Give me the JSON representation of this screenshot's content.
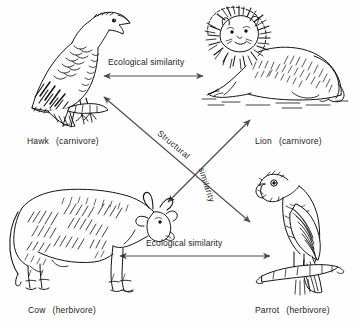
{
  "diagram": {
    "background_color": "#ffffff",
    "ink_color": "#1b1b1b",
    "arrow_color": "#4a4f54",
    "nodes": [
      {
        "id": "hawk",
        "name": "Hawk",
        "diet": "(carnivore)",
        "icon": "hawk-engraving",
        "position": "top-left"
      },
      {
        "id": "lion",
        "name": "Lion",
        "diet": "(carnivore)",
        "icon": "lion-engraving",
        "position": "top-right"
      },
      {
        "id": "cow",
        "name": "Cow",
        "diet": "(herbivore)",
        "icon": "cow-engraving",
        "position": "bottom-left"
      },
      {
        "id": "parrot",
        "name": "Parrot",
        "diet": "(herbivore)",
        "icon": "parrot-engraving",
        "position": "bottom-right"
      }
    ],
    "connections": [
      {
        "id": "hawk-lion",
        "label": "Ecological similarity",
        "from": "hawk",
        "to": "lion",
        "style": "double-headed",
        "orientation": "horizontal"
      },
      {
        "id": "cow-parrot",
        "label": "Ecological similarity",
        "from": "cow",
        "to": "parrot",
        "style": "double-headed",
        "orientation": "horizontal"
      },
      {
        "id": "hawk-parrot",
        "label_line1": "Structural",
        "label_line2": "similarity",
        "from": "hawk",
        "to": "parrot",
        "style": "double-headed",
        "orientation": "diagonal-down-right"
      },
      {
        "id": "cow-lion",
        "label_line1": "Structural",
        "label_line2": "similarity",
        "from": "cow",
        "to": "lion",
        "style": "double-headed",
        "orientation": "diagonal-up-right"
      }
    ],
    "labels": {
      "structural": "Structural",
      "similarity": "similarity",
      "ecological_similarity": "Ecological similarity"
    }
  }
}
